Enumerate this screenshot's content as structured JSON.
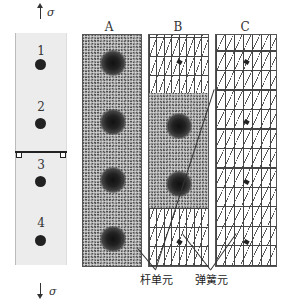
{
  "diagram": {
    "specimen": {
      "stress_symbol_top": "σ",
      "stress_symbol_bottom": "σ",
      "holes": [
        {
          "label": "1"
        },
        {
          "label": "2"
        },
        {
          "label": "3"
        },
        {
          "label": "4"
        }
      ]
    },
    "panels": [
      {
        "title": "A",
        "mesh": "fine-all"
      },
      {
        "title": "B",
        "mesh": "mixed"
      },
      {
        "title": "C",
        "mesh": "coarse-all"
      }
    ],
    "callouts": {
      "bar_element": "杆单元",
      "spring_element": "弹簧元"
    }
  }
}
